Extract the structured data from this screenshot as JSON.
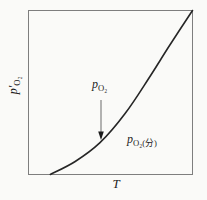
{
  "figure": {
    "background": "#fafaf8",
    "border_color": "#7e7e7e",
    "curve_color": "#262626",
    "arrow_shaft_color": "#6a6a6a",
    "arrow_head_color": "#1a1a1a",
    "labels": {
      "y_axis_base": "p′",
      "y_axis_sub": "O₂",
      "x_axis": "T",
      "arrow_label_base": "p",
      "arrow_label_sub": "O₂",
      "curve_label_base": "p",
      "curve_label_sub": "O₂(分)"
    }
  },
  "chart_data": {
    "type": "line",
    "title": "",
    "xlabel": "T",
    "ylabel": "p′O₂",
    "axes_numeric": false,
    "grid": false,
    "legend": "none",
    "x_range_normalized": [
      0,
      1
    ],
    "y_range_normalized": [
      0,
      1
    ],
    "series": [
      {
        "name": "equilibrium oxygen pressure p′O₂ vs temperature T",
        "shape": "convex-increasing (exponential-like), starts on x-axis and ends at top-right corner of frame",
        "points_normalized": [
          {
            "x": 0.133,
            "y": 0.0
          },
          {
            "x": 0.285,
            "y": 0.079
          },
          {
            "x": 0.436,
            "y": 0.194
          },
          {
            "x": 0.588,
            "y": 0.37
          },
          {
            "x": 0.727,
            "y": 0.576
          },
          {
            "x": 0.861,
            "y": 0.788
          },
          {
            "x": 1.0,
            "y": 1.0
          }
        ]
      }
    ],
    "annotations": [
      {
        "text": "p O₂",
        "type": "label-with-down-arrow",
        "points_to": "curve",
        "x_normalized": 0.443
      },
      {
        "text": "p O₂(分)",
        "type": "curve-label",
        "position": "below-right of curve",
        "x_normalized": 0.63
      }
    ]
  }
}
